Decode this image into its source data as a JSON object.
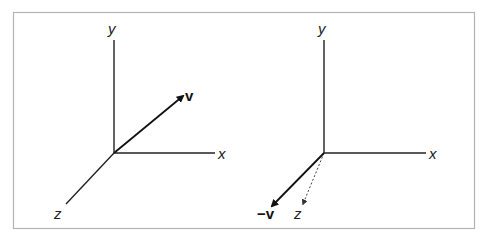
{
  "figure": {
    "frame_color": "#b3b3b3",
    "line_color": "#222222",
    "panels": [
      {
        "id": "left",
        "axis_labels": {
          "x": "x",
          "y": "y",
          "z": "z"
        },
        "vector_label": "v",
        "vector_description": "vector v pointing up-right into positive x/y/-z region"
      },
      {
        "id": "right",
        "axis_labels": {
          "x": "x",
          "y": "y",
          "z": "z"
        },
        "vector_label": "−v",
        "vector_description": "negated vector −v pointing down-left; z axis drawn dotted"
      }
    ]
  }
}
